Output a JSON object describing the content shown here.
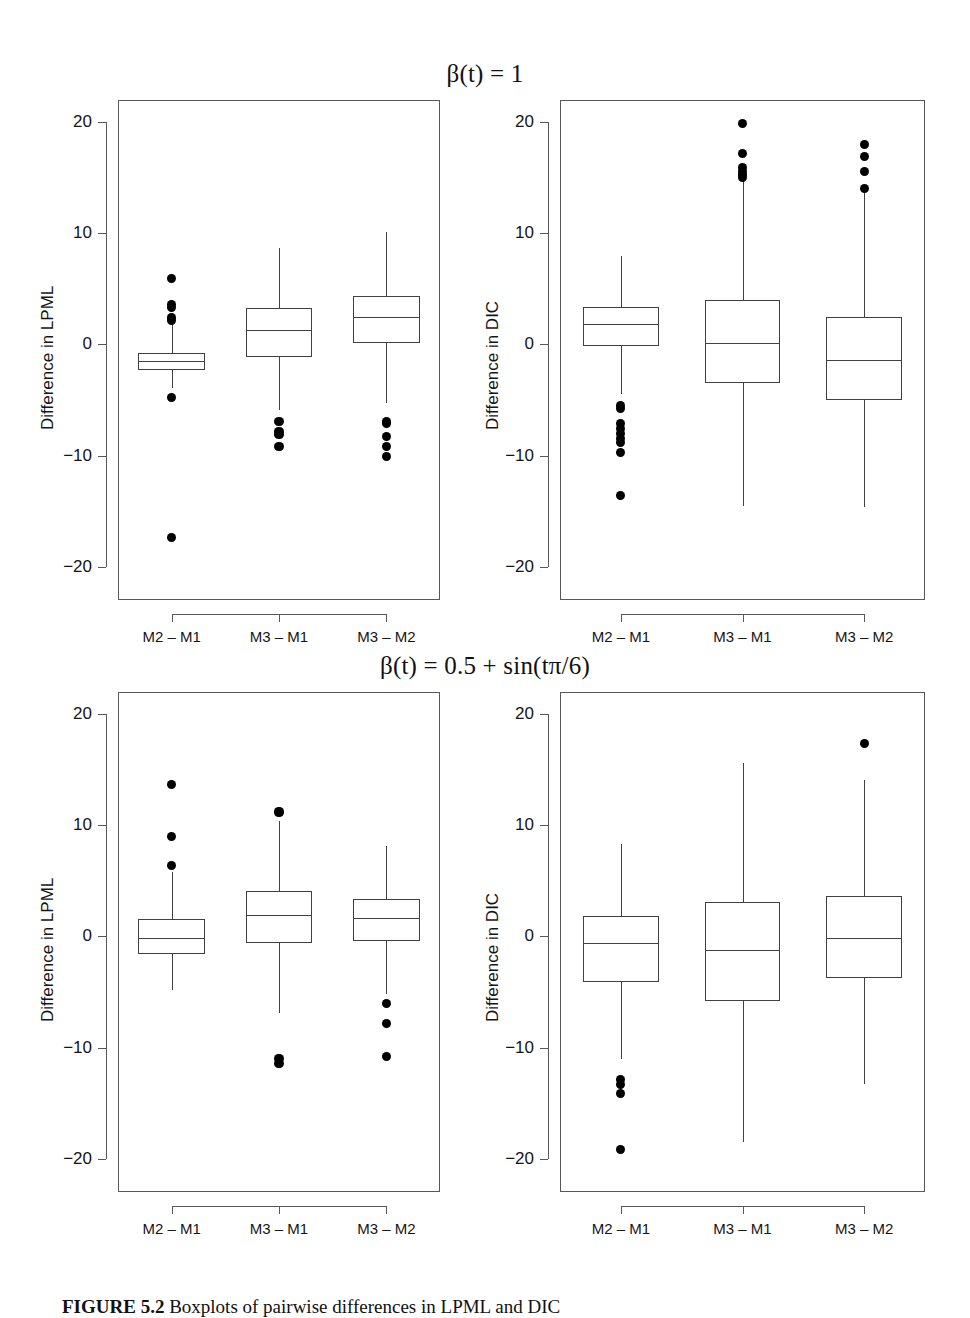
{
  "figure": {
    "caption_label": "FIGURE 5.2",
    "caption_text": "Boxplots of pairwise differences in LPML and DIC"
  },
  "titles": {
    "top": "β(t) = 1",
    "bottom": "β(t) = 0.5 + sin(tπ/6)"
  },
  "axis": {
    "y_ticks": [
      "20",
      "10",
      "0",
      "-10",
      "-20"
    ],
    "y_tick_values": [
      20,
      10,
      0,
      -10,
      -20
    ],
    "y_limits": [
      -23,
      22
    ],
    "x_categories": [
      "M2 – M1",
      "M3 – M1",
      "M3 – M2"
    ],
    "ylabel_lpml": "Difference in LPML",
    "ylabel_dic": "Difference in DIC"
  },
  "chart_data": [
    {
      "type": "box",
      "panel": "top-left",
      "title": "β(t) = 1",
      "ylabel": "Difference in LPML",
      "xlabel": "",
      "ylim": [
        -23,
        22
      ],
      "categories": [
        "M2 – M1",
        "M3 – M1",
        "M3 – M2"
      ],
      "boxes": [
        {
          "category": "M2 – M1",
          "whisker_low": -3.9,
          "q1": -2.3,
          "median": -1.5,
          "q3": -0.8,
          "whisker_high": 2.0,
          "outliers": [
            5.9,
            3.6,
            3.3,
            2.4,
            2.2,
            -4.8,
            -17.4
          ]
        },
        {
          "category": "M3 – M1",
          "whisker_low": -5.9,
          "q1": -1.1,
          "median": 1.3,
          "q3": 3.3,
          "whisker_high": 8.7,
          "outliers": [
            -6.9,
            -7.8,
            -8.1,
            -9.2
          ]
        },
        {
          "category": "M3 – M2",
          "whisker_low": -5.3,
          "q1": 0.1,
          "median": 2.5,
          "q3": 4.4,
          "whisker_high": 10.1,
          "outliers": [
            -6.9,
            -7.1,
            -8.3,
            -9.2,
            -10.1
          ]
        }
      ]
    },
    {
      "type": "box",
      "panel": "top-right",
      "title": "β(t) = 1",
      "ylabel": "Difference in DIC",
      "xlabel": "",
      "ylim": [
        -23,
        22
      ],
      "categories": [
        "M2 – M1",
        "M3 – M1",
        "M3 – M2"
      ],
      "boxes": [
        {
          "category": "M2 – M1",
          "whisker_low": -4.5,
          "q1": -0.1,
          "median": 1.8,
          "q3": 3.4,
          "whisker_high": 8.0,
          "outliers": [
            -5.5,
            -5.8,
            -7.1,
            -7.6,
            -8.0,
            -8.5,
            -8.8,
            -9.7,
            -13.6
          ]
        },
        {
          "category": "M3 – M1",
          "whisker_low": -14.5,
          "q1": -3.5,
          "median": 0.1,
          "q3": 4.0,
          "whisker_high": 14.8,
          "outliers": [
            19.9,
            17.2,
            15.9,
            15.6,
            15.3,
            15.0
          ]
        },
        {
          "category": "M3 – M2",
          "whisker_low": -14.6,
          "q1": -5.0,
          "median": -1.4,
          "q3": 2.5,
          "whisker_high": 13.6,
          "outliers": [
            18.0,
            16.9,
            15.6,
            14.0
          ]
        }
      ]
    },
    {
      "type": "box",
      "panel": "bottom-left",
      "title": "β(t) = 0.5 + sin(tπ/6)",
      "ylabel": "Difference in LPML",
      "xlabel": "",
      "ylim": [
        -23,
        22
      ],
      "categories": [
        "M2 – M1",
        "M3 – M1",
        "M3 – M2"
      ],
      "boxes": [
        {
          "category": "M2 – M1",
          "whisker_low": -4.8,
          "q1": -1.6,
          "median": -0.1,
          "q3": 1.6,
          "whisker_high": 5.8,
          "outliers": [
            13.7,
            9.0,
            6.4
          ]
        },
        {
          "category": "M3 – M1",
          "whisker_low": -6.9,
          "q1": -0.6,
          "median": 1.9,
          "q3": 4.1,
          "whisker_high": 10.4,
          "outliers": [
            11.2,
            -11.0,
            -11.4
          ]
        },
        {
          "category": "M3 – M2",
          "whisker_low": -5.2,
          "q1": -0.4,
          "median": 1.7,
          "q3": 3.4,
          "whisker_high": 8.1,
          "outliers": [
            -6.0,
            -7.8,
            -10.8
          ]
        }
      ]
    },
    {
      "type": "box",
      "panel": "bottom-right",
      "title": "β(t) = 0.5 + sin(tπ/6)",
      "ylabel": "Difference in DIC",
      "xlabel": "",
      "ylim": [
        -23,
        22
      ],
      "categories": [
        "M2 – M1",
        "M3 – M1",
        "M3 – M2"
      ],
      "boxes": [
        {
          "category": "M2 – M1",
          "whisker_low": -11.0,
          "q1": -4.1,
          "median": -0.6,
          "q3": 1.8,
          "whisker_high": 8.3,
          "outliers": [
            -12.9,
            -13.3,
            -14.1,
            -19.2
          ]
        },
        {
          "category": "M3 – M1",
          "whisker_low": -18.5,
          "q1": -5.8,
          "median": -1.2,
          "q3": 3.1,
          "whisker_high": 15.6,
          "outliers": []
        },
        {
          "category": "M3 – M2",
          "whisker_low": -13.3,
          "q1": -3.7,
          "median": -0.1,
          "q3": 3.6,
          "whisker_high": 14.1,
          "outliers": [
            17.4
          ]
        }
      ]
    }
  ]
}
